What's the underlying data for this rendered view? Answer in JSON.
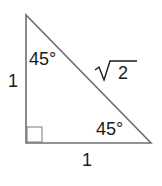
{
  "diagram": {
    "type": "right-triangle",
    "colors": {
      "stroke": "#6f6f6f",
      "text": "#1a1a1a",
      "background": "#ffffff"
    },
    "labels": {
      "top_angle": "45°",
      "bottom_right_angle": "45°",
      "left_side": "1",
      "bottom_side": "1",
      "hypotenuse_radicand": "2"
    },
    "right_angle_marker": true
  }
}
